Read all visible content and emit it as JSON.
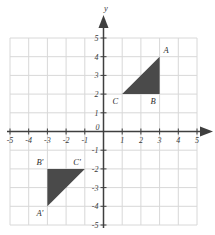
{
  "chart_data": {
    "type": "scatter",
    "title": "",
    "xlabel": "",
    "ylabel": "y",
    "axis_names": {
      "x": "",
      "y": "y"
    },
    "xlim": [
      -5,
      5
    ],
    "ylim": [
      -5,
      5
    ],
    "grid": true,
    "legend": "none",
    "xticks": [
      "-5",
      "-4",
      "-3",
      "-2",
      "-1",
      "0",
      "1",
      "2",
      "3",
      "4",
      "5"
    ],
    "yticks": [
      "-5",
      "-4",
      "-3",
      "-2",
      "-1",
      "1",
      "2",
      "3",
      "4",
      "5"
    ],
    "origin_label": "0",
    "shapes": [
      {
        "name": "triangle-ABC",
        "fill": "#4a4a4a",
        "vertices": [
          {
            "label": "A",
            "x": 3,
            "y": 4,
            "label_pos": "above-right"
          },
          {
            "label": "B",
            "x": 3,
            "y": 2,
            "label_pos": "below-left"
          },
          {
            "label": "C",
            "x": 1,
            "y": 2,
            "label_pos": "below-left"
          }
        ]
      },
      {
        "name": "triangle-A-prime-B-prime-C-prime",
        "fill": "#4a4a4a",
        "vertices": [
          {
            "label": "A'",
            "x": -3,
            "y": -4,
            "label_pos": "below-left"
          },
          {
            "label": "B'",
            "x": -3,
            "y": -2,
            "label_pos": "above-left"
          },
          {
            "label": "C'",
            "x": -1,
            "y": -2,
            "label_pos": "above-left"
          }
        ]
      }
    ]
  },
  "colors": {
    "background": "#ffffff",
    "grid_line": "#d8d8d8",
    "axis_line": "#3f3f3f",
    "shape_fill": "#4a4a4a",
    "label_text": "#2e2e2e"
  },
  "ticks": {
    "x": [
      {
        "value": -5,
        "label": "-5"
      },
      {
        "value": -4,
        "label": "-4"
      },
      {
        "value": -3,
        "label": "-3"
      },
      {
        "value": -2,
        "label": "-2"
      },
      {
        "value": -1,
        "label": "-1"
      },
      {
        "value": 1,
        "label": "1"
      },
      {
        "value": 2,
        "label": "2"
      },
      {
        "value": 3,
        "label": "3"
      },
      {
        "value": 4,
        "label": "4"
      },
      {
        "value": 5,
        "label": "5"
      }
    ],
    "y": [
      {
        "value": 5,
        "label": "5"
      },
      {
        "value": 4,
        "label": "4"
      },
      {
        "value": 3,
        "label": "3"
      },
      {
        "value": 2,
        "label": "2"
      },
      {
        "value": 1,
        "label": "1"
      },
      {
        "value": -1,
        "label": "-1"
      },
      {
        "value": -2,
        "label": "-2"
      },
      {
        "value": -3,
        "label": "-3"
      },
      {
        "value": -4,
        "label": "-4"
      },
      {
        "value": -5,
        "label": "-5"
      }
    ],
    "origin": "0"
  },
  "axis_labels": {
    "y_axis_name": "y"
  }
}
